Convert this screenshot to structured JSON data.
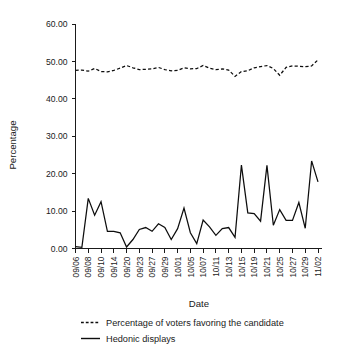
{
  "chart_data": {
    "type": "line",
    "title": "",
    "xlabel": "Date",
    "ylabel": "Percentage",
    "ylim": [
      0,
      60
    ],
    "yticks": [
      0,
      10,
      20,
      30,
      40,
      50,
      60
    ],
    "ytick_labels": [
      "0.00",
      "10.00",
      "20.00",
      "30.00",
      "40.00",
      "50.00",
      "60.00"
    ],
    "grid": false,
    "legend_position": "below",
    "x": [
      "09/06",
      "09/07",
      "09/08",
      "09/09",
      "09/10",
      "09/13",
      "09/14",
      "09/15",
      "09/20",
      "09/21",
      "09/23",
      "09/24",
      "09/27",
      "09/28",
      "09/29",
      "09/30",
      "10/01",
      "10/04",
      "10/05",
      "10/06",
      "10/07",
      "10/08",
      "10/11",
      "10/12",
      "10/13",
      "10/14",
      "10/15",
      "10/18",
      "10/19",
      "10/20",
      "10/21",
      "10/22",
      "10/25",
      "10/26",
      "10/27",
      "10/28",
      "10/29",
      "11/01",
      "11/02"
    ],
    "xtick_labels": [
      "09/06",
      "09/08",
      "09/10",
      "09/14",
      "09/20",
      "09/23",
      "09/27",
      "09/29",
      "10/01",
      "10/05",
      "10/07",
      "10/11",
      "10/13",
      "10/15",
      "10/19",
      "10/21",
      "10/25",
      "10/27",
      "10/29",
      "11/02"
    ],
    "series": [
      {
        "name": "Percentage of voters favoring the candidate",
        "style": "dashed",
        "color": "#0d0d0d",
        "values": [
          47.6,
          47.7,
          47.4,
          48.1,
          47.3,
          47.2,
          47.6,
          48.2,
          48.9,
          48.3,
          47.8,
          47.9,
          48.0,
          48.4,
          47.8,
          47.5,
          47.6,
          48.3,
          48.0,
          48.1,
          48.9,
          48.2,
          47.8,
          48.0,
          47.7,
          46.0,
          47.3,
          47.5,
          48.3,
          48.6,
          48.9,
          48.1,
          46.3,
          48.4,
          48.8,
          48.7,
          48.6,
          48.8,
          50.4
        ]
      },
      {
        "name": "Hedonic displays",
        "style": "solid",
        "color": "#0d0d0d",
        "values": [
          0.5,
          0.3,
          13.4,
          8.9,
          12.5,
          4.6,
          4.6,
          4.2,
          0.4,
          2.4,
          5.1,
          5.6,
          4.6,
          6.6,
          5.6,
          2.4,
          5.3,
          10.8,
          4.2,
          1.3,
          7.6,
          5.8,
          3.5,
          5.3,
          5.6,
          3.0,
          22.3,
          9.5,
          9.3,
          7.3,
          22.2,
          6.2,
          10.4,
          7.5,
          7.5,
          12.3,
          5.4,
          23.4,
          17.8
        ]
      }
    ]
  },
  "legend": {
    "items": [
      {
        "label": "Percentage of voters favoring the candidate",
        "style": "dashed"
      },
      {
        "label": "Hedonic displays",
        "style": "solid"
      }
    ]
  },
  "axes": {
    "x_title": "Date",
    "y_title": "Percentage"
  },
  "caption": {
    "text": ""
  }
}
